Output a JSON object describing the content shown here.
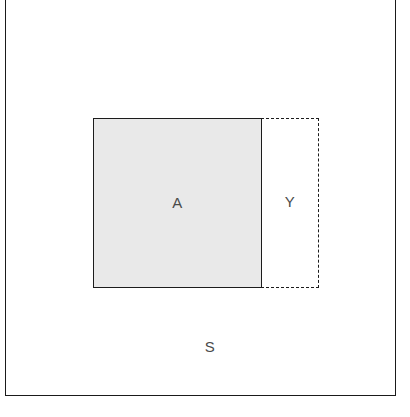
{
  "diagram": {
    "type": "venn-set-diagram",
    "title": "",
    "universe": {
      "label": "S",
      "name": "universal-set",
      "border_style": "solid",
      "border_color": "#1a1a1a",
      "fill_color": "#ffffff"
    },
    "regions": [
      {
        "label": "A",
        "name": "set-a",
        "border_style": "solid",
        "border_color": "#1c1c1c",
        "fill_color": "#e9e9e9",
        "shaded": true
      },
      {
        "label": "Y",
        "name": "set-y",
        "border_style": "dashed",
        "border_color": "#1c1c1c",
        "fill_color": "#ffffff",
        "shaded": false
      }
    ],
    "label_color": "#4a4a4a"
  }
}
